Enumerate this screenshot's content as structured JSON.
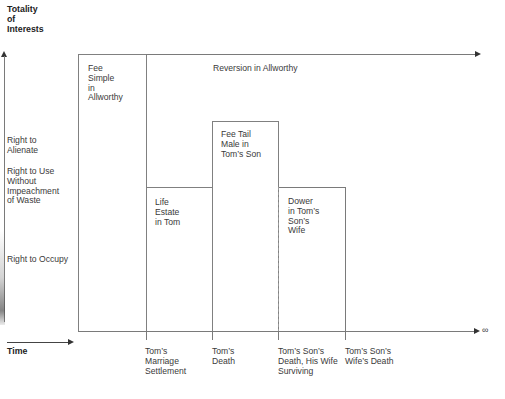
{
  "axes": {
    "y_label": "Totality\nof\nInterests",
    "x_label": "Time",
    "infinity_symbol": "∞"
  },
  "y_levels": [
    {
      "label": "Right to\nAlienate"
    },
    {
      "label": "Right to Use\nWithout\nImpeachment\nof Waste"
    },
    {
      "label": "Right to Occupy"
    }
  ],
  "estates": {
    "fee_simple": "Fee\nSimple\nin\nAllworthy",
    "reversion": "Reversion in Allworthy",
    "life_estate": "Life\nEstate\nin Tom",
    "fee_tail": "Fee Tail\nMale in\nTom’s Son",
    "dower": "Dower\nin Tom’s\nSon’s\nWife"
  },
  "time_events": [
    {
      "label": "Tom’s\nMarriage\nSettlement"
    },
    {
      "label": "Tom’s\nDeath"
    },
    {
      "label": "Tom’s Son’s\nDeath, His Wife\nSurviving"
    },
    {
      "label": "Tom’s Son’s\nWife’s Death"
    }
  ],
  "colors": {
    "line": "#7a7a7a",
    "text": "#3a3a3a",
    "arrow": "#333333"
  }
}
